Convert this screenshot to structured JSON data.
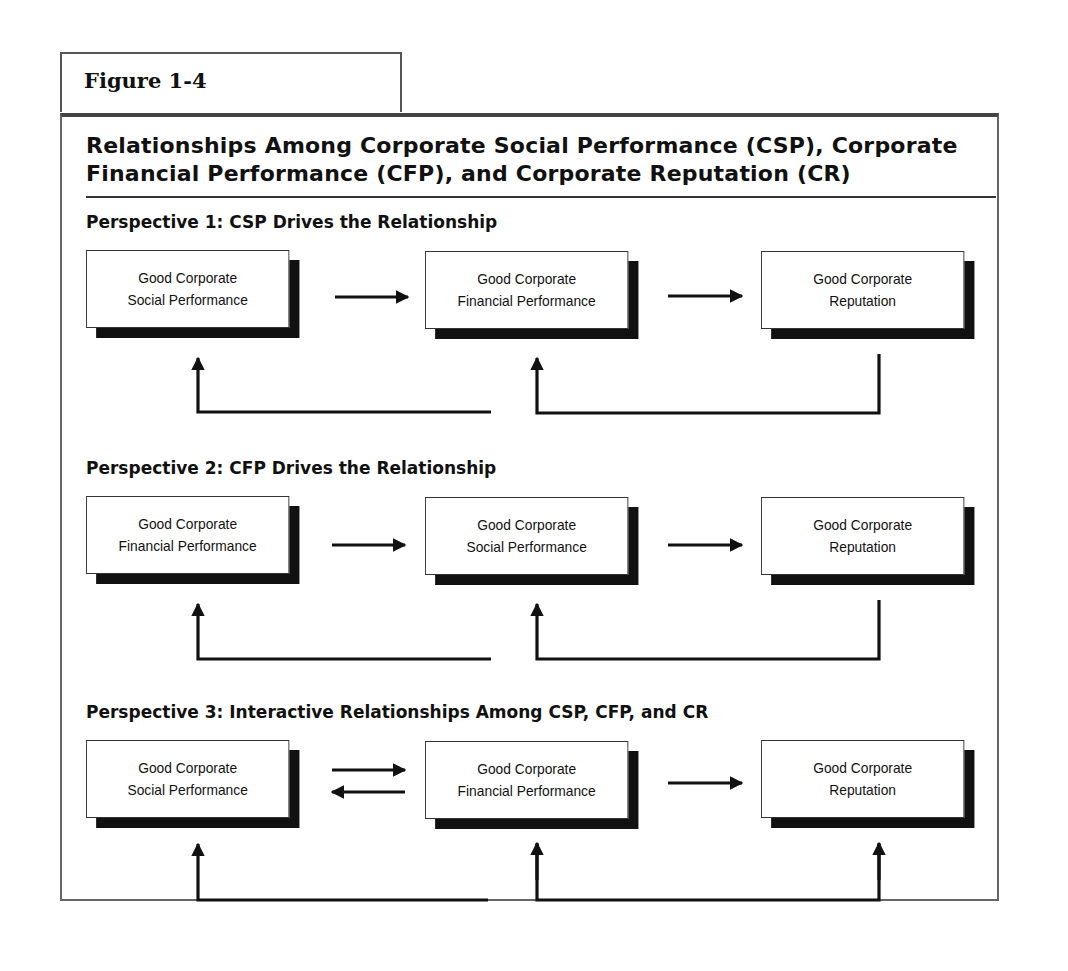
{
  "figure_label": "Figure 1-4",
  "title_line1": "Relationships Among Corporate Social Performance (CSP), Corporate",
  "title_line2": "Financial Performance (CFP), and Corporate Reputation (CR)",
  "perspectives": [
    {
      "heading": "Perspective 1: CSP Drives the Relationship",
      "boxes": [
        {
          "line1": "Good Corporate",
          "line2": "Social Performance"
        },
        {
          "line1": "Good Corporate",
          "line2": "Financial Performance"
        },
        {
          "line1": "Good Corporate",
          "line2": "Reputation"
        }
      ],
      "forward_arrows": [
        "box1->box2",
        "box2->box3"
      ],
      "feedback": "CR feeds back to CFP and to CSP"
    },
    {
      "heading": "Perspective 2: CFP Drives the Relationship",
      "boxes": [
        {
          "line1": "Good Corporate",
          "line2": "Financial Performance"
        },
        {
          "line1": "Good Corporate",
          "line2": "Social Performance"
        },
        {
          "line1": "Good Corporate",
          "line2": "Reputation"
        }
      ],
      "forward_arrows": [
        "box1->box2",
        "box2->box3"
      ],
      "feedback": "CR feeds back to CSP and to CFP"
    },
    {
      "heading": "Perspective 3: Interactive Relationships Among CSP, CFP, and CR",
      "boxes": [
        {
          "line1": "Good Corporate",
          "line2": "Social Performance"
        },
        {
          "line1": "Good Corporate",
          "line2": "Financial Performance"
        },
        {
          "line1": "Good Corporate",
          "line2": "Reputation"
        }
      ],
      "forward_arrows": [
        "box1<->box2",
        "box2->box3"
      ],
      "feedback": "Arrows up into all three boxes"
    }
  ],
  "colors": {
    "ink": "#111111",
    "frame": "#555555",
    "background": "#ffffff"
  }
}
